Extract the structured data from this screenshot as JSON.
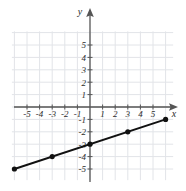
{
  "chart_data": {
    "type": "line",
    "title": "",
    "xlabel": "x",
    "ylabel": "y",
    "grid": true,
    "legend": "none",
    "xlim": [
      -6.5,
      7
    ],
    "ylim": [
      -6,
      6.3
    ],
    "xticks": [
      -5,
      -4,
      -3,
      -2,
      -1,
      1,
      2,
      3,
      4,
      5
    ],
    "yticks": [
      5,
      4,
      3,
      2,
      1,
      -1,
      -2,
      -3,
      -4,
      -5
    ],
    "xtick_labels": [
      "-5",
      "-4",
      "-3",
      "-2",
      "-1",
      "1",
      "2",
      "3",
      "4",
      "5"
    ],
    "ytick_labels": [
      "5",
      "4",
      "3",
      "2",
      "1",
      "-1",
      "-2",
      "-3",
      "-4",
      "-5"
    ],
    "series": [
      {
        "name": "line",
        "slope": 0.3333,
        "intercept": -3,
        "color": "#111111",
        "x": [
          -6,
          -3,
          0,
          3,
          6
        ],
        "values": [
          -5,
          -4,
          -3,
          -2,
          -1
        ],
        "markers": true
      }
    ]
  },
  "axes": {
    "x_axis_name": "x",
    "y_axis_name": "y"
  },
  "style": {
    "axis_color": "#555555",
    "grid_color": "#e2e4e8",
    "line_color": "#111111",
    "point_color": "#111111",
    "background": "#ffffff"
  }
}
